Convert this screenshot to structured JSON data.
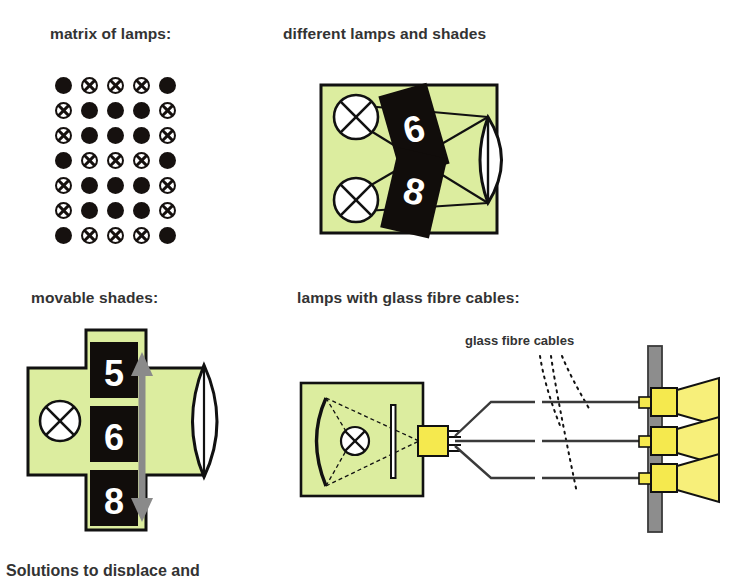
{
  "headings": {
    "matrix": "matrix of lamps:",
    "different": "different lamps and shades",
    "movable": "movable shades:",
    "fibre": "lamps with glass fibre cables:"
  },
  "labels": {
    "glass_fibre_cables": "glass fibre cables",
    "bottom_caption": "Solutions to displace and"
  },
  "colors": {
    "housing_green": "#dced9f",
    "outline": "#111111",
    "shade_black": "#110d0b",
    "fixture_yellow": "#f5e94e",
    "beam_yellow": "#f7ef7a",
    "wall_gray": "#8d8d8d",
    "arrow_gray": "#8a8a8a",
    "text": "#333333"
  },
  "matrix": {
    "rows": 7,
    "cols": 5,
    "legend": {
      "on": "filled-lamp",
      "off": "crossed-lamp"
    },
    "pattern": [
      [
        "on",
        "off",
        "off",
        "off",
        "on"
      ],
      [
        "off",
        "on",
        "on",
        "on",
        "off"
      ],
      [
        "off",
        "on",
        "on",
        "on",
        "off"
      ],
      [
        "on",
        "off",
        "off",
        "off",
        "on"
      ],
      [
        "off",
        "on",
        "on",
        "on",
        "off"
      ],
      [
        "off",
        "on",
        "on",
        "on",
        "off"
      ],
      [
        "on",
        "off",
        "off",
        "off",
        "on"
      ]
    ]
  },
  "different_lamps_panel": {
    "shades": [
      {
        "label": "6",
        "rotation": -16
      },
      {
        "label": "8",
        "rotation": 13
      }
    ],
    "lamp_count": 2,
    "lens_count": 1
  },
  "movable_shades_panel": {
    "shades": [
      {
        "label": "5",
        "position": "top"
      },
      {
        "label": "6",
        "position": "middle"
      },
      {
        "label": "8",
        "position": "bottom"
      }
    ],
    "arrow": "double-headed-vertical",
    "lamp_count": 1,
    "lens_count": 1
  },
  "fibre_panel": {
    "cable_count": 3,
    "fixture_count": 3,
    "has_reflector": true,
    "has_filter_bar": true,
    "connector": "fibre-coupler"
  }
}
